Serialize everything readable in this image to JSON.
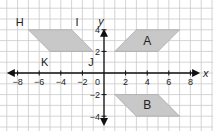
{
  "grid": {
    "origin_px": [
      104,
      73
    ],
    "unit_px": 10.8,
    "line_color": "#c9c9c9",
    "background": "#ffffff",
    "x_range_units": [
      -9.7,
      10
    ],
    "y_range_units": [
      -5.4,
      6.8
    ]
  },
  "axes": {
    "x_label": "x",
    "y_label": "y",
    "x_ticks": [
      -8,
      -6,
      -4,
      -2,
      2,
      4,
      6,
      8
    ],
    "y_ticks": [
      4,
      2,
      -2,
      -4
    ],
    "origin_label": "0",
    "axis_color": "#111111",
    "x_arrow_left": -9,
    "x_arrow_right": 8.9,
    "y_arrow_top": 4.1,
    "y_arrow_bottom": -4.9
  },
  "shapes": [
    {
      "name": "HIJK",
      "fill": "#c8c8c8",
      "stroke": "#aaaaaa",
      "vertices": [
        [
          -7,
          4
        ],
        [
          -3,
          4
        ],
        [
          -1,
          2
        ],
        [
          -5,
          2
        ]
      ],
      "vertex_labels": [
        {
          "text": "H",
          "at": [
            -7.8,
            4.7
          ]
        },
        {
          "text": "I",
          "at": [
            -2.5,
            4.7
          ]
        },
        {
          "text": "J",
          "at": [
            -1.2,
            1.0
          ]
        },
        {
          "text": "K",
          "at": [
            -5.5,
            1.0
          ]
        }
      ]
    },
    {
      "name": "A",
      "fill": "#c8c8c8",
      "stroke": "#aaaaaa",
      "vertices": [
        [
          1,
          2
        ],
        [
          3,
          4
        ],
        [
          7,
          4
        ],
        [
          5,
          2
        ]
      ],
      "center_label": {
        "text": "A",
        "at": [
          4,
          3
        ]
      }
    },
    {
      "name": "B",
      "fill": "#c8c8c8",
      "stroke": "#aaaaaa",
      "vertices": [
        [
          1,
          -2
        ],
        [
          5,
          -2
        ],
        [
          7,
          -4
        ],
        [
          3,
          -4
        ]
      ],
      "center_label": {
        "text": "B",
        "at": [
          4,
          -3
        ]
      }
    }
  ]
}
